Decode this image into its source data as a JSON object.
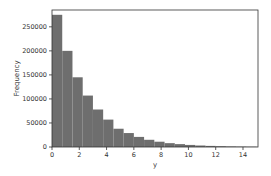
{
  "chart_data": {
    "type": "bar",
    "subtype": "histogram",
    "title": "",
    "xlabel": "y",
    "ylabel": "Frequency",
    "xlim": [
      0,
      15.1
    ],
    "ylim": [
      0,
      285000
    ],
    "bin_width": 0.75,
    "bin_edges_start": 0,
    "values": [
      275000,
      200000,
      145000,
      107000,
      78000,
      57000,
      38000,
      29000,
      21000,
      15000,
      11000,
      8000,
      6000,
      4300,
      3100,
      2300,
      1700,
      1200,
      900,
      650
    ],
    "x_ticks": [
      0,
      2,
      4,
      6,
      8,
      10,
      12,
      14
    ],
    "y_ticks": [
      0,
      50000,
      100000,
      150000,
      200000,
      250000
    ],
    "bar_color": "#6e6e6e",
    "grid": false,
    "legend": null
  }
}
